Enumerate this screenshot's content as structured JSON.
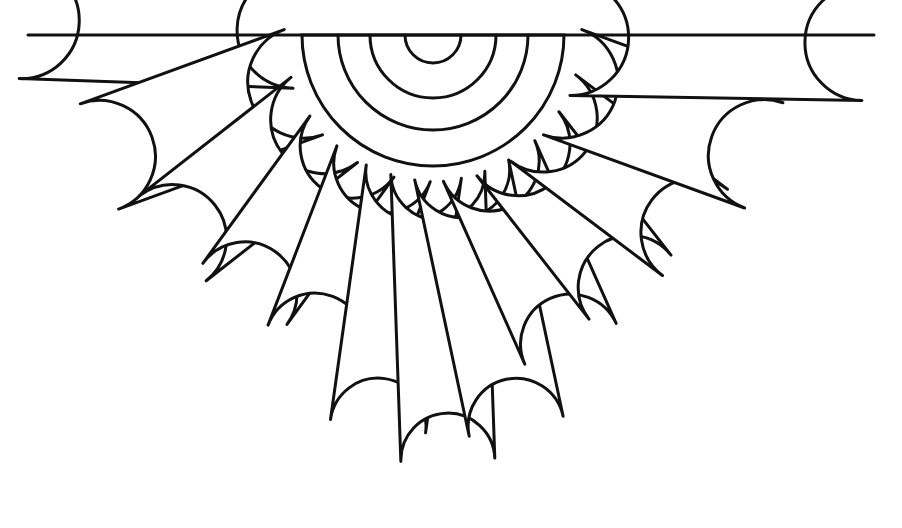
{
  "document": {
    "title": "Hand Fan Coloring Outline",
    "background_color": "#ffffff",
    "ink_color": "#111111",
    "canvas": {
      "width": 902,
      "height": 528
    }
  },
  "figure": {
    "name": "fan-line-drawing",
    "style": "line-art",
    "fill": "#ffffff",
    "stroke": "#111111",
    "stroke_width": 3.0,
    "pivot": {
      "x": 433,
      "y": 35
    },
    "baseline": {
      "y": 35,
      "x_start": 28,
      "x_end": 874
    }
  },
  "core_arcs": {
    "name": "concentric-arcs",
    "count": 4,
    "center": {
      "x": 433,
      "y": 35
    },
    "radii": [
      28,
      63,
      95,
      131
    ],
    "stroke_width": 3.0,
    "note": "Nested semicircles opening downward from the top baseline at the fan pivot."
  },
  "petals": {
    "count": 13,
    "inner_radius": 138,
    "stroke_width": 3.0,
    "items": [
      {
        "id": "petal-1",
        "label": "petal 1 left outer",
        "angle_deg": 182,
        "outer_radius": 412,
        "half_width": 58
      },
      {
        "id": "petal-2",
        "label": "petal 2",
        "angle_deg": 160,
        "outer_radius": 355,
        "half_width": 56
      },
      {
        "id": "petal-3",
        "label": "petal 3",
        "angle_deg": 142,
        "outer_radius": 330,
        "half_width": 54
      },
      {
        "id": "petal-4",
        "label": "petal 4",
        "angle_deg": 126,
        "outer_radius": 320,
        "half_width": 52
      },
      {
        "id": "petal-5",
        "label": "petal 5",
        "angle_deg": 111,
        "outer_radius": 330,
        "half_width": 50
      },
      {
        "id": "petal-6",
        "label": "petal 6",
        "angle_deg": 98,
        "outer_radius": 395,
        "half_width": 48
      },
      {
        "id": "petal-7",
        "label": "petal 7 center",
        "angle_deg": 88,
        "outer_radius": 425,
        "half_width": 47
      },
      {
        "id": "petal-8",
        "label": "petal 8",
        "angle_deg": 78,
        "outer_radius": 400,
        "half_width": 48
      },
      {
        "id": "petal-9",
        "label": "petal 9",
        "angle_deg": 66,
        "outer_radius": 338,
        "half_width": 50
      },
      {
        "id": "petal-10",
        "label": "petal 10",
        "angle_deg": 52,
        "outer_radius": 320,
        "half_width": 52
      },
      {
        "id": "petal-11",
        "label": "petal 11",
        "angle_deg": 37,
        "outer_radius": 328,
        "half_width": 54
      },
      {
        "id": "petal-12",
        "label": "petal 12",
        "angle_deg": 20,
        "outer_radius": 352,
        "half_width": 56
      },
      {
        "id": "petal-13",
        "label": "petal 13 right outer",
        "angle_deg": 1,
        "outer_radius": 430,
        "half_width": 58
      }
    ]
  }
}
